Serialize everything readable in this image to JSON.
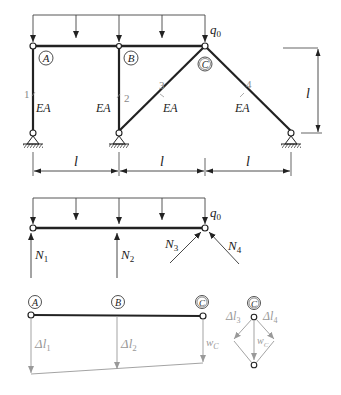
{
  "figure": {
    "structure": {
      "nodes": {
        "A": "A",
        "B": "B",
        "C": "C"
      },
      "load": "q",
      "load_sub": "0",
      "bars": [
        {
          "id": "1",
          "stiffness": "EA"
        },
        {
          "id": "2",
          "stiffness": "EA"
        },
        {
          "id": "3",
          "stiffness": "EA"
        },
        {
          "id": "4",
          "stiffness": "EA"
        }
      ],
      "dims": {
        "height": "l",
        "span1": "l",
        "span2": "l",
        "span3": "l"
      }
    },
    "free_body": {
      "load": "q",
      "load_sub": "0",
      "forces": [
        {
          "sym": "N",
          "sub": "1"
        },
        {
          "sym": "N",
          "sub": "2"
        },
        {
          "sym": "N",
          "sub": "3"
        },
        {
          "sym": "N",
          "sub": "4"
        }
      ]
    },
    "displacement": {
      "nodes": {
        "A": "A",
        "B": "B",
        "C": "C"
      },
      "labels": [
        {
          "sym": "Δl",
          "sub": "1"
        },
        {
          "sym": "Δl",
          "sub": "2"
        },
        {
          "sym": "w",
          "sub": "C"
        }
      ],
      "node_detail": {
        "node": "C",
        "labels": [
          {
            "sym": "Δl",
            "sub": "3"
          },
          {
            "sym": "Δl",
            "sub": "4"
          },
          {
            "sym": "w",
            "sub": "C"
          }
        ]
      }
    }
  }
}
